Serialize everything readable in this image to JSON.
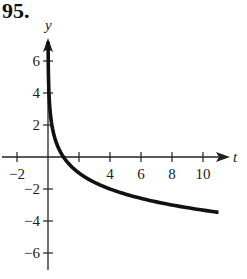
{
  "problem": {
    "number": "95."
  },
  "chart_data": {
    "type": "line",
    "title": "",
    "xlabel": "t",
    "ylabel": "y",
    "xlim": [
      -3,
      11.5
    ],
    "ylim": [
      -7,
      7.5
    ],
    "x_ticks": [
      -2,
      2,
      4,
      6,
      8,
      10
    ],
    "x_tick_labels": [
      "−2",
      "",
      "4",
      "6",
      "8",
      "10"
    ],
    "y_ticks": [
      -6,
      -4,
      -2,
      2,
      4,
      6
    ],
    "y_tick_labels": [
      "−6",
      "−4",
      "−2",
      "2",
      "4",
      "6"
    ],
    "grid": false,
    "series": [
      {
        "name": "y = -log2(t)",
        "x": [
          0.01,
          0.05,
          0.1,
          0.25,
          0.5,
          1,
          2,
          3,
          4,
          6,
          8,
          10,
          11
        ],
        "values": [
          6.64,
          4.32,
          3.32,
          2.0,
          1.0,
          0,
          -1.0,
          -1.58,
          -2.0,
          -2.58,
          -3.0,
          -3.32,
          -3.46
        ]
      }
    ],
    "colors": {
      "curve": "#111111",
      "axes": "#222222"
    }
  }
}
